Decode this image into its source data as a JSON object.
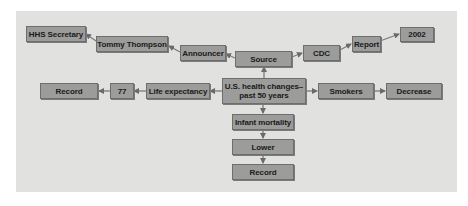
{
  "diagram": {
    "type": "concept-map",
    "colors": {
      "background": "#ffffff",
      "panel": "#e1e1e0",
      "node_fill": "#9c9c9b",
      "node_border": "#6e6e6e",
      "arrow": "#6a6a6a",
      "text": "#1a1a1a"
    },
    "nodes": {
      "center": {
        "label": "U.S. health changes–\npast 50 years"
      },
      "source": {
        "label": "Source"
      },
      "announcer": {
        "label": "Announcer"
      },
      "tommy_thompson": {
        "label": "Tommy Thompson"
      },
      "hhs_secretary": {
        "label": "HHS Secretary"
      },
      "cdc": {
        "label": "CDC"
      },
      "report": {
        "label": "Report"
      },
      "year_2002": {
        "label": "2002"
      },
      "life_expectancy": {
        "label": "Life expectancy"
      },
      "value_77": {
        "label": "77"
      },
      "record_left": {
        "label": "Record"
      },
      "smokers": {
        "label": "Smokers"
      },
      "decrease": {
        "label": "Decrease"
      },
      "infant_mortality": {
        "label": "Infant mortality"
      },
      "lower": {
        "label": "Lower"
      },
      "record_bottom": {
        "label": "Record"
      }
    },
    "edges": [
      {
        "from": "center",
        "to": "source"
      },
      {
        "from": "source",
        "to": "announcer"
      },
      {
        "from": "announcer",
        "to": "tommy_thompson"
      },
      {
        "from": "tommy_thompson",
        "to": "hhs_secretary"
      },
      {
        "from": "source",
        "to": "cdc"
      },
      {
        "from": "cdc",
        "to": "report"
      },
      {
        "from": "report",
        "to": "year_2002"
      },
      {
        "from": "center",
        "to": "life_expectancy"
      },
      {
        "from": "life_expectancy",
        "to": "value_77"
      },
      {
        "from": "value_77",
        "to": "record_left"
      },
      {
        "from": "center",
        "to": "smokers"
      },
      {
        "from": "smokers",
        "to": "decrease"
      },
      {
        "from": "center",
        "to": "infant_mortality"
      },
      {
        "from": "infant_mortality",
        "to": "lower"
      },
      {
        "from": "lower",
        "to": "record_bottom"
      }
    ]
  }
}
